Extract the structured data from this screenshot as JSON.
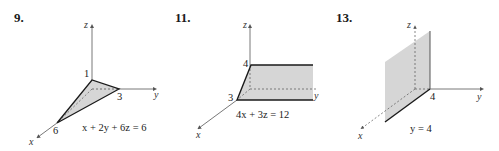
{
  "figures": [
    {
      "number": "9.",
      "equation": "x + 2y + 6z = 6",
      "axes": {
        "x": "x",
        "y": "y",
        "z": "z"
      },
      "intercepts": {
        "x": "6",
        "y": "3",
        "z": "1"
      },
      "shape": "triangle"
    },
    {
      "number": "11.",
      "equation": "4x + 3z = 12",
      "axes": {
        "x": "x",
        "y": "y",
        "z": "z"
      },
      "intercepts": {
        "x": "3",
        "z": "4"
      },
      "shape": "plane-parallel-to-y-axis"
    },
    {
      "number": "13.",
      "equation": "y = 4",
      "axes": {
        "x": "x",
        "y": "y",
        "z": "z"
      },
      "intercepts": {
        "y": "4"
      },
      "shape": "plane-parallel-to-xz-plane"
    }
  ],
  "colors": {
    "fill": "#d6d6d6",
    "line": "#1a1a1a",
    "axis": "#555555"
  }
}
